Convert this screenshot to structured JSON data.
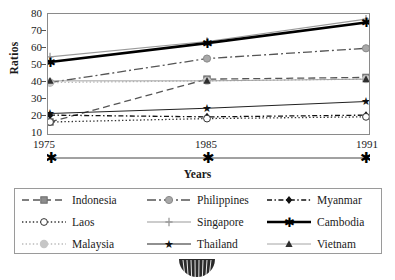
{
  "chart_data": {
    "type": "line",
    "title": "",
    "xlabel": "Years",
    "ylabel": "Ratios",
    "x": [
      1975,
      1985,
      1991
    ],
    "xticklabels": [
      "1975",
      "1985",
      "1991"
    ],
    "ylim": [
      10,
      80
    ],
    "yticks": [
      10,
      20,
      30,
      40,
      50,
      60,
      70,
      80
    ],
    "yticklabels": [
      "10",
      "20",
      "30",
      "40",
      "50",
      "60",
      "70",
      "80"
    ],
    "grid": false,
    "legend_position": "bottom",
    "series": [
      {
        "name": "Indonesia",
        "values": [
          17,
          42,
          43
        ],
        "color": "#555555",
        "marker": "square",
        "linestyle": "dashed"
      },
      {
        "name": "Philippines",
        "values": [
          40,
          54,
          60
        ],
        "color": "#555555",
        "marker": "circle-gray",
        "linestyle": "dashdot"
      },
      {
        "name": "Myanmar",
        "values": [
          21,
          20,
          21
        ],
        "color": "#111111",
        "marker": "diamond",
        "linestyle": "dashdot-fine"
      },
      {
        "name": "Laos",
        "values": [
          17,
          19,
          20
        ],
        "color": "#333333",
        "marker": "circle-open",
        "linestyle": "dotted"
      },
      {
        "name": "Singapore",
        "values": [
          55,
          64,
          77
        ],
        "color": "#9a9a9a",
        "marker": "plus",
        "linestyle": "solid"
      },
      {
        "name": "Cambodia",
        "values": [
          52,
          63,
          75
        ],
        "color": "#000000",
        "marker": "asterisk",
        "linestyle": "solid-thick"
      },
      {
        "name": "Malaysia",
        "values": [
          40,
          41,
          42
        ],
        "color": "#bbbbbb",
        "marker": "blob",
        "linestyle": "dotted"
      },
      {
        "name": "Thailand",
        "values": [
          22,
          25,
          29
        ],
        "color": "#222222",
        "marker": "star",
        "linestyle": "solid"
      },
      {
        "name": "Vietnam",
        "values": [
          41,
          41,
          42
        ],
        "color": "#9a9a9a",
        "marker": "triangle",
        "linestyle": "solid-thin"
      }
    ]
  },
  "legend": {
    "items": [
      {
        "label": "Indonesia"
      },
      {
        "label": "Philippines"
      },
      {
        "label": "Myanmar"
      },
      {
        "label": "Laos"
      },
      {
        "label": "Singapore"
      },
      {
        "label": "Cambodia"
      },
      {
        "label": "Malaysia"
      },
      {
        "label": "Thailand"
      },
      {
        "label": "Vietnam"
      }
    ]
  }
}
